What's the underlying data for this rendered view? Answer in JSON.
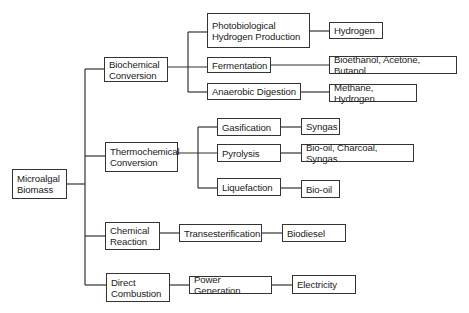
{
  "diagram": {
    "type": "tree",
    "root": {
      "id": "microalgal",
      "label": "Microalgal\nBiomass"
    },
    "nodes": {
      "microalgal": "Microalgal\nBiomass",
      "biochemical": "Biochemical\nConversion",
      "thermochemical": "Thermochemical\nConversion",
      "chemical": "Chemical\nReaction",
      "direct": "Direct\nCombustion",
      "photobio": "Photobiological\nHydrogen Production",
      "fermentation": "Fermentation",
      "anaerobic": "Anaerobic Digestion",
      "gasification": "Gasification",
      "pyrolysis": "Pyrolysis",
      "liquefaction": "Liquefaction",
      "transesterification": "Transesterification",
      "power": "Power Generation",
      "hydrogen": "Hydrogen",
      "bioethanol": "Bioethanol, Acetone, Butanol",
      "methane": "Methane, Hydrogen",
      "syngas": "Syngas",
      "biooil_mix": "Bio-oil, Charcoal, Syngas",
      "biooil": "Bio-oil",
      "biodiesel": "Biodiesel",
      "electricity": "Electricity"
    },
    "edges": [
      [
        "microalgal",
        "biochemical"
      ],
      [
        "microalgal",
        "thermochemical"
      ],
      [
        "microalgal",
        "chemical"
      ],
      [
        "microalgal",
        "direct"
      ],
      [
        "biochemical",
        "photobio"
      ],
      [
        "biochemical",
        "fermentation"
      ],
      [
        "biochemical",
        "anaerobic"
      ],
      [
        "thermochemical",
        "gasification"
      ],
      [
        "thermochemical",
        "pyrolysis"
      ],
      [
        "thermochemical",
        "liquefaction"
      ],
      [
        "chemical",
        "transesterification"
      ],
      [
        "direct",
        "power"
      ],
      [
        "photobio",
        "hydrogen"
      ],
      [
        "fermentation",
        "bioethanol"
      ],
      [
        "anaerobic",
        "methane"
      ],
      [
        "gasification",
        "syngas"
      ],
      [
        "pyrolysis",
        "biooil_mix"
      ],
      [
        "liquefaction",
        "biooil"
      ],
      [
        "transesterification",
        "biodiesel"
      ],
      [
        "power",
        "electricity"
      ]
    ]
  }
}
